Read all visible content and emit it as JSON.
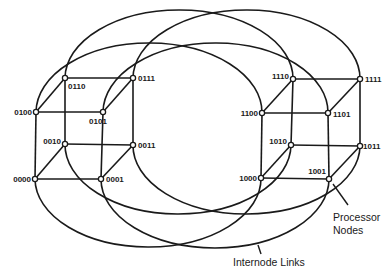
{
  "diagram": {
    "nodes": [
      {
        "id": "0000",
        "label": "0000",
        "x": 35,
        "y": 179
      },
      {
        "id": "0001",
        "label": "0001",
        "x": 101,
        "y": 179
      },
      {
        "id": "0010",
        "label": "0010",
        "x": 65,
        "y": 144
      },
      {
        "id": "0011",
        "label": "0011",
        "x": 133,
        "y": 145
      },
      {
        "id": "0100",
        "label": "0100",
        "x": 36,
        "y": 112
      },
      {
        "id": "0101",
        "label": "0101",
        "x": 103,
        "y": 112
      },
      {
        "id": "0110",
        "label": "0110",
        "x": 65,
        "y": 78
      },
      {
        "id": "0111",
        "label": "0111",
        "x": 133,
        "y": 78
      },
      {
        "id": "1000",
        "label": "1000",
        "x": 261,
        "y": 178
      },
      {
        "id": "1001",
        "label": "1001",
        "x": 329,
        "y": 179
      },
      {
        "id": "1010",
        "label": "1010",
        "x": 291,
        "y": 145
      },
      {
        "id": "1011",
        "label": "1011",
        "x": 360,
        "y": 146
      },
      {
        "id": "1100",
        "label": "1100",
        "x": 262,
        "y": 113
      },
      {
        "id": "1101",
        "label": "1101",
        "x": 328,
        "y": 113
      },
      {
        "id": "1110",
        "label": "1110",
        "x": 293,
        "y": 79
      },
      {
        "id": "1111",
        "label": "1111",
        "x": 360,
        "y": 79
      }
    ],
    "cube_edges": [
      [
        "0000",
        "0001"
      ],
      [
        "0010",
        "0011"
      ],
      [
        "0100",
        "0101"
      ],
      [
        "0110",
        "0111"
      ],
      [
        "0000",
        "0010"
      ],
      [
        "0001",
        "0011"
      ],
      [
        "0100",
        "0110"
      ],
      [
        "0101",
        "0111"
      ],
      [
        "0000",
        "0100"
      ],
      [
        "0001",
        "0101"
      ],
      [
        "0010",
        "0110"
      ],
      [
        "0011",
        "0111"
      ],
      [
        "1000",
        "1001"
      ],
      [
        "1010",
        "1011"
      ],
      [
        "1100",
        "1101"
      ],
      [
        "1110",
        "1111"
      ],
      [
        "1000",
        "1010"
      ],
      [
        "1001",
        "1011"
      ],
      [
        "1100",
        "1110"
      ],
      [
        "1101",
        "1111"
      ],
      [
        "1000",
        "1100"
      ],
      [
        "1001",
        "1101"
      ],
      [
        "1010",
        "1110"
      ],
      [
        "1011",
        "1111"
      ]
    ],
    "internode_links": [
      {
        "from": "0110",
        "to": "1110",
        "direction": "up",
        "extreme_y": 10
      },
      {
        "from": "0111",
        "to": "1111",
        "direction": "up",
        "extreme_y": 10
      },
      {
        "from": "0100",
        "to": "1100",
        "direction": "up",
        "extreme_y": 43
      },
      {
        "from": "0101",
        "to": "1101",
        "direction": "up",
        "extreme_y": 43
      },
      {
        "from": "0010",
        "to": "1010",
        "direction": "down",
        "extreme_y": 214
      },
      {
        "from": "0011",
        "to": "1011",
        "direction": "down",
        "extreme_y": 214
      },
      {
        "from": "0000",
        "to": "1000",
        "direction": "down",
        "extreme_y": 247
      },
      {
        "from": "0001",
        "to": "1001",
        "direction": "down",
        "extreme_y": 248
      }
    ],
    "captions": {
      "processor_nodes_line1": "Processor",
      "processor_nodes_line2": "Nodes",
      "internode_links": "Internode Links"
    },
    "colors": {
      "line": "#1a1a1a",
      "background": "#ffffff"
    }
  }
}
